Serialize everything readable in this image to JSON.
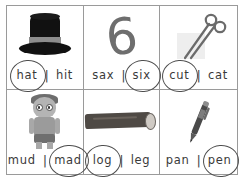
{
  "worksheet": {
    "title": "Short vowel word-picture matching worksheet",
    "border_color": "#9a9a9a",
    "text_color": "#3a3a3a",
    "circle_color": "#4d4d4d",
    "separator": "|",
    "cells": [
      {
        "id": "cell-hat",
        "picture": "top-hat",
        "picture_label": "top hat",
        "options": [
          {
            "text": "hat",
            "circled": true
          },
          {
            "text": "hit",
            "circled": false
          }
        ]
      },
      {
        "id": "cell-six",
        "picture": "digit-six",
        "picture_label": "6",
        "options": [
          {
            "text": "sax",
            "circled": false
          },
          {
            "text": "six",
            "circled": true
          }
        ]
      },
      {
        "id": "cell-cut",
        "picture": "scissors",
        "picture_label": "scissors cutting paper",
        "options": [
          {
            "text": "cut",
            "circled": true
          },
          {
            "text": "cat",
            "circled": false
          }
        ]
      },
      {
        "id": "cell-mad",
        "picture": "angry-boy",
        "picture_label": "angry boy",
        "options": [
          {
            "text": "mud",
            "circled": false
          },
          {
            "text": "mad",
            "circled": true
          }
        ]
      },
      {
        "id": "cell-log",
        "picture": "log",
        "picture_label": "wooden log",
        "options": [
          {
            "text": "log",
            "circled": true
          },
          {
            "text": "leg",
            "circled": false
          }
        ]
      },
      {
        "id": "cell-pen",
        "picture": "pen",
        "picture_label": "ballpoint pen",
        "options": [
          {
            "text": "pan",
            "circled": false
          },
          {
            "text": "pen",
            "circled": true
          }
        ]
      }
    ]
  }
}
